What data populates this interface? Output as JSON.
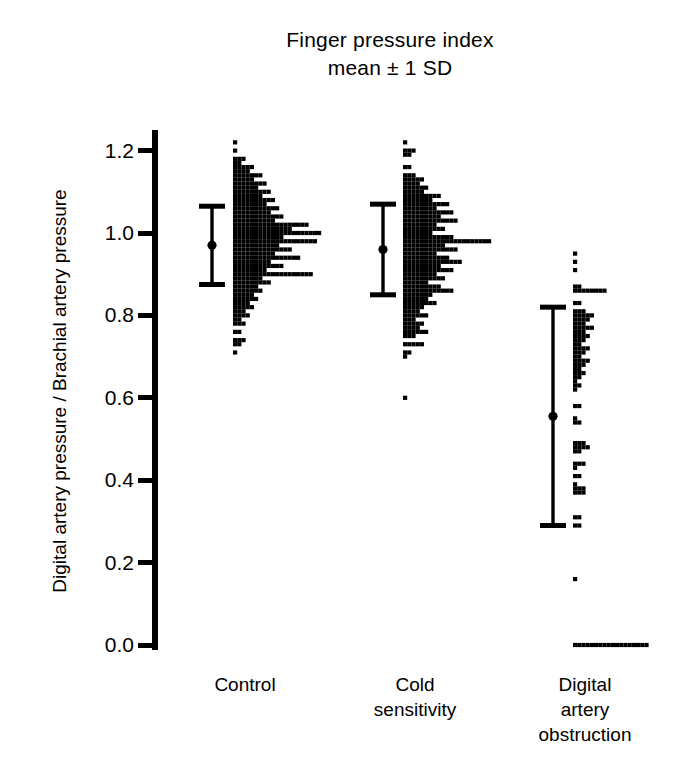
{
  "figure": {
    "title_lines": [
      "Finger pressure index",
      "mean ± 1 SD"
    ],
    "y_axis_label": "Digital artery pressure / Brachial artery pressure",
    "ink_color": "#000000",
    "background_color": "#ffffff"
  },
  "chart_data": {
    "type": "scatter",
    "title": "Finger pressure index mean ± 1 SD",
    "subtitle": "mean ± 1 SD",
    "xlabel": "",
    "ylabel": "Digital artery pressure / Brachial artery pressure",
    "ylim": [
      0.0,
      1.25
    ],
    "yticks": [
      0.0,
      0.2,
      0.4,
      0.6,
      0.8,
      1.0,
      1.2
    ],
    "ytick_labels": [
      "0.0",
      "0.2",
      "0.4",
      "0.6",
      "0.8",
      "1.0",
      "1.2"
    ],
    "grid": false,
    "legend": "none",
    "plot_style": "dot-histogram with mean ± 1 SD error bar",
    "categories": [
      "Control",
      "Cold sensitivity",
      "Digital artery obstruction"
    ],
    "category_label_lines": [
      [
        "Control"
      ],
      [
        "Cold",
        "sensitivity"
      ],
      [
        "Digital",
        "artery",
        "obstruction"
      ]
    ],
    "series": [
      {
        "name": "Control",
        "mean": 0.97,
        "sd": 0.095,
        "error_bar": {
          "upper": 1.065,
          "lower": 0.875
        },
        "dot_rows": [
          {
            "value": 1.22,
            "count": 1
          },
          {
            "value": 1.2,
            "count": 1
          },
          {
            "value": 1.18,
            "count": 3
          },
          {
            "value": 1.17,
            "count": 2
          },
          {
            "value": 1.16,
            "count": 5
          },
          {
            "value": 1.15,
            "count": 4
          },
          {
            "value": 1.14,
            "count": 7
          },
          {
            "value": 1.13,
            "count": 5
          },
          {
            "value": 1.12,
            "count": 8
          },
          {
            "value": 1.11,
            "count": 6
          },
          {
            "value": 1.1,
            "count": 9
          },
          {
            "value": 1.09,
            "count": 7
          },
          {
            "value": 1.08,
            "count": 10
          },
          {
            "value": 1.07,
            "count": 8
          },
          {
            "value": 1.06,
            "count": 11
          },
          {
            "value": 1.05,
            "count": 9
          },
          {
            "value": 1.04,
            "count": 12
          },
          {
            "value": 1.03,
            "count": 10
          },
          {
            "value": 1.02,
            "count": 18
          },
          {
            "value": 1.01,
            "count": 14
          },
          {
            "value": 1.0,
            "count": 21
          },
          {
            "value": 0.99,
            "count": 12
          },
          {
            "value": 0.98,
            "count": 20
          },
          {
            "value": 0.97,
            "count": 11
          },
          {
            "value": 0.96,
            "count": 14
          },
          {
            "value": 0.95,
            "count": 10
          },
          {
            "value": 0.94,
            "count": 16
          },
          {
            "value": 0.93,
            "count": 9
          },
          {
            "value": 0.92,
            "count": 12
          },
          {
            "value": 0.91,
            "count": 8
          },
          {
            "value": 0.9,
            "count": 19
          },
          {
            "value": 0.89,
            "count": 7
          },
          {
            "value": 0.88,
            "count": 9
          },
          {
            "value": 0.87,
            "count": 6
          },
          {
            "value": 0.86,
            "count": 7
          },
          {
            "value": 0.85,
            "count": 5
          },
          {
            "value": 0.84,
            "count": 6
          },
          {
            "value": 0.83,
            "count": 4
          },
          {
            "value": 0.82,
            "count": 5
          },
          {
            "value": 0.81,
            "count": 3
          },
          {
            "value": 0.8,
            "count": 4
          },
          {
            "value": 0.79,
            "count": 2
          },
          {
            "value": 0.78,
            "count": 3
          },
          {
            "value": 0.76,
            "count": 2
          },
          {
            "value": 0.74,
            "count": 3
          },
          {
            "value": 0.73,
            "count": 2
          },
          {
            "value": 0.71,
            "count": 1
          }
        ]
      },
      {
        "name": "Cold sensitivity",
        "mean": 0.96,
        "sd": 0.11,
        "error_bar": {
          "upper": 1.07,
          "lower": 0.85
        },
        "dot_rows": [
          {
            "value": 1.22,
            "count": 1
          },
          {
            "value": 1.2,
            "count": 3
          },
          {
            "value": 1.19,
            "count": 2
          },
          {
            "value": 1.16,
            "count": 2
          },
          {
            "value": 1.14,
            "count": 3
          },
          {
            "value": 1.13,
            "count": 5
          },
          {
            "value": 1.12,
            "count": 4
          },
          {
            "value": 1.11,
            "count": 6
          },
          {
            "value": 1.1,
            "count": 5
          },
          {
            "value": 1.09,
            "count": 9
          },
          {
            "value": 1.08,
            "count": 7
          },
          {
            "value": 1.07,
            "count": 11
          },
          {
            "value": 1.06,
            "count": 8
          },
          {
            "value": 1.05,
            "count": 12
          },
          {
            "value": 1.04,
            "count": 9
          },
          {
            "value": 1.03,
            "count": 13
          },
          {
            "value": 1.02,
            "count": 8
          },
          {
            "value": 1.01,
            "count": 10
          },
          {
            "value": 1.0,
            "count": 7
          },
          {
            "value": 0.99,
            "count": 12
          },
          {
            "value": 0.98,
            "count": 21
          },
          {
            "value": 0.97,
            "count": 10
          },
          {
            "value": 0.96,
            "count": 13
          },
          {
            "value": 0.95,
            "count": 8
          },
          {
            "value": 0.94,
            "count": 11
          },
          {
            "value": 0.93,
            "count": 14
          },
          {
            "value": 0.92,
            "count": 9
          },
          {
            "value": 0.91,
            "count": 12
          },
          {
            "value": 0.9,
            "count": 8
          },
          {
            "value": 0.89,
            "count": 10
          },
          {
            "value": 0.88,
            "count": 6
          },
          {
            "value": 0.87,
            "count": 9
          },
          {
            "value": 0.86,
            "count": 12
          },
          {
            "value": 0.85,
            "count": 7
          },
          {
            "value": 0.84,
            "count": 6
          },
          {
            "value": 0.83,
            "count": 8
          },
          {
            "value": 0.82,
            "count": 5
          },
          {
            "value": 0.81,
            "count": 4
          },
          {
            "value": 0.8,
            "count": 6
          },
          {
            "value": 0.79,
            "count": 3
          },
          {
            "value": 0.78,
            "count": 5
          },
          {
            "value": 0.77,
            "count": 4
          },
          {
            "value": 0.76,
            "count": 6
          },
          {
            "value": 0.75,
            "count": 3
          },
          {
            "value": 0.73,
            "count": 5
          },
          {
            "value": 0.71,
            "count": 2
          },
          {
            "value": 0.7,
            "count": 1
          },
          {
            "value": 0.6,
            "count": 1
          }
        ]
      },
      {
        "name": "Digital artery obstruction",
        "mean": 0.555,
        "sd": 0.265,
        "error_bar": {
          "upper": 0.82,
          "lower": 0.29
        },
        "dot_rows": [
          {
            "value": 0.95,
            "count": 1
          },
          {
            "value": 0.93,
            "count": 1
          },
          {
            "value": 0.91,
            "count": 1
          },
          {
            "value": 0.87,
            "count": 2
          },
          {
            "value": 0.86,
            "count": 8
          },
          {
            "value": 0.83,
            "count": 2
          },
          {
            "value": 0.81,
            "count": 3
          },
          {
            "value": 0.8,
            "count": 5
          },
          {
            "value": 0.79,
            "count": 4
          },
          {
            "value": 0.78,
            "count": 3
          },
          {
            "value": 0.77,
            "count": 5
          },
          {
            "value": 0.76,
            "count": 3
          },
          {
            "value": 0.75,
            "count": 4
          },
          {
            "value": 0.74,
            "count": 3
          },
          {
            "value": 0.73,
            "count": 2
          },
          {
            "value": 0.72,
            "count": 4
          },
          {
            "value": 0.71,
            "count": 3
          },
          {
            "value": 0.7,
            "count": 2
          },
          {
            "value": 0.69,
            "count": 4
          },
          {
            "value": 0.68,
            "count": 3
          },
          {
            "value": 0.67,
            "count": 2
          },
          {
            "value": 0.66,
            "count": 3
          },
          {
            "value": 0.65,
            "count": 2
          },
          {
            "value": 0.64,
            "count": 1
          },
          {
            "value": 0.63,
            "count": 2
          },
          {
            "value": 0.62,
            "count": 1
          },
          {
            "value": 0.58,
            "count": 2
          },
          {
            "value": 0.55,
            "count": 1
          },
          {
            "value": 0.54,
            "count": 2
          },
          {
            "value": 0.49,
            "count": 3
          },
          {
            "value": 0.48,
            "count": 4
          },
          {
            "value": 0.47,
            "count": 2
          },
          {
            "value": 0.44,
            "count": 3
          },
          {
            "value": 0.43,
            "count": 1
          },
          {
            "value": 0.41,
            "count": 2
          },
          {
            "value": 0.39,
            "count": 1
          },
          {
            "value": 0.38,
            "count": 3
          },
          {
            "value": 0.37,
            "count": 3
          },
          {
            "value": 0.31,
            "count": 2
          },
          {
            "value": 0.29,
            "count": 2
          },
          {
            "value": 0.16,
            "count": 1
          },
          {
            "value": 0.0,
            "count": 18
          }
        ]
      }
    ]
  },
  "geometry": {
    "axis_x": 155,
    "y_top_value": 1.25,
    "y_bottom_value": 0.0,
    "y_top_px": 130,
    "y_bottom_px": 645,
    "group_base_x": [
      233,
      403,
      573
    ],
    "error_bar_x": [
      212,
      383,
      553
    ],
    "dot_size": 4.2,
    "dot_pitch": 4.2,
    "row_pitch": 4.2
  }
}
